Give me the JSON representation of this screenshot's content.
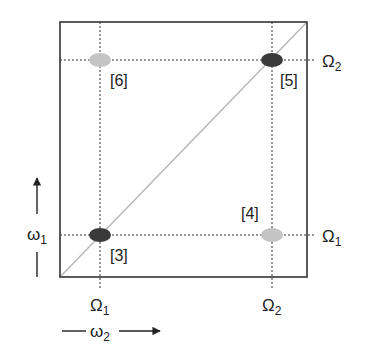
{
  "diagram": {
    "type": "2D frequency map",
    "colors": {
      "dark": "#3a3a3a",
      "light": "#c4c4c4",
      "diagonal": "#b8b8b8",
      "frame": "#333333"
    },
    "peaks": [
      {
        "id": "3",
        "label": "[3]",
        "tone": "dark",
        "x_label": "Ω1",
        "y_label": "Ω1"
      },
      {
        "id": "4",
        "label": "[4]",
        "tone": "light",
        "x_label": "Ω2",
        "y_label": "Ω1"
      },
      {
        "id": "5",
        "label": "[5]",
        "tone": "dark",
        "x_label": "Ω2",
        "y_label": "Ω2"
      },
      {
        "id": "6",
        "label": "[6]",
        "tone": "light",
        "x_label": "Ω1",
        "y_label": "Ω2"
      }
    ],
    "x_ticks": {
      "omega1": "Ω",
      "omega1_sub": "1",
      "omega2": "Ω",
      "omega2_sub": "2"
    },
    "y_ticks": {
      "omega1": "Ω",
      "omega1_sub": "1",
      "omega2": "Ω",
      "omega2_sub": "2"
    },
    "x_axis": {
      "symbol": "ω",
      "sub": "2"
    },
    "y_axis": {
      "symbol": "ω",
      "sub": "1"
    }
  }
}
